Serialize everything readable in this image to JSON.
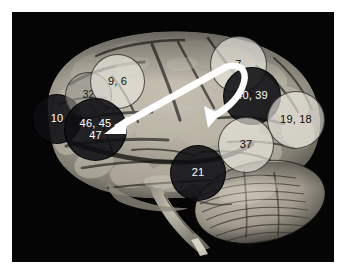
{
  "figure": {
    "background_color": "#ffffff",
    "plate_color": "#050505",
    "specimen": "human-brain-lateral-photograph"
  },
  "markers": [
    {
      "id": "area-10",
      "name": "marker-area-10",
      "lines": [
        "10"
      ],
      "style": "dark",
      "x": 20,
      "y": 82,
      "size": 50,
      "font_size": 11,
      "text_color": "#ffffff"
    },
    {
      "id": "area-32",
      "name": "marker-area-32",
      "lines": [
        "32"
      ],
      "style": "mid",
      "x": 53,
      "y": 60,
      "size": 47,
      "font_size": 10,
      "text_color": "#0f0f0f"
    },
    {
      "id": "area-9-6",
      "name": "marker-area-9-6",
      "lines": [
        "9, 6"
      ],
      "style": "light",
      "x": 78,
      "y": 42,
      "size": 55,
      "font_size": 11,
      "text_color": "#0d0d0d"
    },
    {
      "id": "area-46-45-47",
      "name": "marker-area-46-45-47",
      "lines": [
        "46, 45",
        "47"
      ],
      "style": "dark",
      "x": 52,
      "y": 86,
      "size": 63,
      "font_size": 11,
      "text_color": "#ffffff"
    },
    {
      "id": "area-21",
      "name": "marker-area-21",
      "lines": [
        "21"
      ],
      "style": "dark",
      "x": 158,
      "y": 133,
      "size": 56,
      "font_size": 11,
      "text_color": "#ffffff"
    },
    {
      "id": "area-7",
      "name": "marker-area-7",
      "lines": [
        "7"
      ],
      "style": "light",
      "x": 198,
      "y": 24,
      "size": 57,
      "font_size": 11,
      "text_color": "#0d0d0d"
    },
    {
      "id": "area-40-39",
      "name": "marker-area-40-39",
      "lines": [
        "40, 39"
      ],
      "style": "dark",
      "x": 211,
      "y": 55,
      "size": 58,
      "font_size": 11,
      "text_color": "#ffffff"
    },
    {
      "id": "area-19-18",
      "name": "marker-area-19-18",
      "lines": [
        "19, 18"
      ],
      "style": "light",
      "x": 255,
      "y": 79,
      "size": 58,
      "font_size": 11,
      "text_color": "#0d0d0d"
    },
    {
      "id": "area-37",
      "name": "marker-area-37",
      "lines": [
        "37"
      ],
      "style": "light",
      "x": 206,
      "y": 105,
      "size": 56,
      "font_size": 11,
      "text_color": "#0d0d0d"
    }
  ],
  "arrow": {
    "name": "double-headed-connection-arrow",
    "color": "#ffffff",
    "description": "curved double-headed arrow linking parietal region to prefrontal region",
    "head_count": 2
  }
}
